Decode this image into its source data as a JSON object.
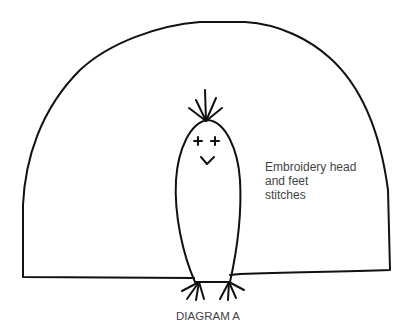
{
  "diagram": {
    "annotation": {
      "lines": [
        "Embroidery head",
        "and feet",
        "stitches"
      ]
    },
    "caption": "DIAGRAM A",
    "colors": {
      "stroke": "#111111",
      "text": "#444444",
      "background": "#ffffff"
    },
    "figure": {
      "outline": "dome-shaped pattern piece",
      "character": "penguin-like figure with tufted head, cross-stitch eyes, v-shaped mouth and two forked feet"
    }
  }
}
